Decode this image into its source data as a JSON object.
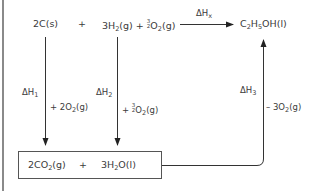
{
  "diagram": {
    "type": "hess-cycle",
    "top_row": {
      "reactant_1": "2C(s)",
      "plus_1": "+",
      "reactant_2_prefix": "3H",
      "reactant_2_sub": "2",
      "reactant_2_mid": "(g) + ",
      "reactant_2_frac_num": "3",
      "reactant_2_frac_den": "2",
      "reactant_2_o": "O",
      "reactant_2_o_sub": "2",
      "reactant_2_suffix": "(g)",
      "arrow_label_main": "ΔH",
      "arrow_label_sub": "x",
      "product_c": "C",
      "product_c_sub": "2",
      "product_h": "H",
      "product_h_sub": "5",
      "product_suffix": "OH(l)"
    },
    "left_path": {
      "dh_main": "ΔH",
      "dh_sub": "1",
      "reagent_prefix": "+ 2O",
      "reagent_sub": "2",
      "reagent_suffix": "(g)"
    },
    "middle_path": {
      "dh_main": "ΔH",
      "dh_sub": "2",
      "reagent_prefix": "+ ",
      "reagent_frac_num": "3",
      "reagent_frac_den": "2",
      "reagent_o": "O",
      "reagent_o_sub": "2",
      "reagent_suffix": "(g)"
    },
    "right_path": {
      "dh_main": "ΔH",
      "dh_sub": "3",
      "reagent_prefix": "– 3O",
      "reagent_sub": "2",
      "reagent_suffix": "(g)"
    },
    "bottom_box": {
      "co2_prefix": "2CO",
      "co2_sub": "2",
      "co2_suffix": "(g)",
      "plus": "+",
      "h2o_prefix": "3H",
      "h2o_sub": "2",
      "h2o_suffix": "O(l)"
    },
    "colors": {
      "text": "#3a3a3a",
      "line": "#555555",
      "frame": "#8a8a8a"
    }
  }
}
